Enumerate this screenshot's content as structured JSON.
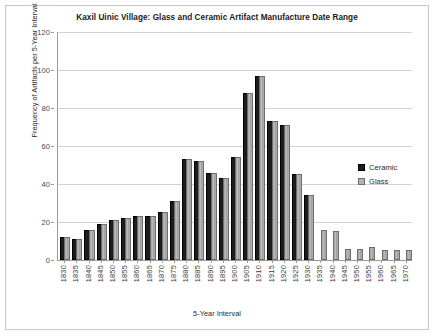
{
  "chart_data": {
    "type": "bar",
    "title": "Kaxil Uinic Village: Glass and Ceramic Artifact Manufacture Date Range",
    "xlabel": "5-Year Interval",
    "ylabel": "Frequency of Artifacts per 5-Year Interval",
    "ylim": [
      0,
      120
    ],
    "ytick_step": 20,
    "yticks": [
      0,
      20,
      40,
      60,
      80,
      100,
      120
    ],
    "grid": true,
    "legend_position": "right-middle",
    "categories": [
      "1830",
      "1835",
      "1840",
      "1845",
      "1850",
      "1855",
      "1860",
      "1865",
      "1870",
      "1875",
      "1880",
      "1885",
      "1890",
      "1895",
      "1900",
      "1905",
      "1910",
      "1915",
      "1920",
      "1925",
      "1930",
      "1935",
      "1940",
      "1945",
      "1950",
      "1955",
      "1960",
      "1965",
      "1970"
    ],
    "series": [
      {
        "name": "Ceramic",
        "color": "#1c1c1c",
        "values": [
          11,
          10,
          15,
          18,
          20,
          21,
          22,
          22,
          24,
          30,
          52,
          51,
          45,
          42,
          53,
          87,
          96,
          72,
          70,
          44,
          33,
          0,
          0,
          0,
          0,
          0,
          0,
          0,
          0
        ]
      },
      {
        "name": "Glass",
        "color": "#b4b4b4",
        "values": [
          11,
          10,
          15,
          18,
          20,
          21,
          22,
          22,
          24,
          30,
          52,
          51,
          45,
          42,
          53,
          87,
          96,
          72,
          70,
          44,
          33,
          15,
          14,
          5,
          5,
          6,
          4,
          4,
          4
        ]
      }
    ]
  },
  "legend": {
    "items": [
      {
        "label": "Ceramic",
        "swatch": "ceramic"
      },
      {
        "label": "Glass",
        "swatch": "glass"
      }
    ]
  }
}
